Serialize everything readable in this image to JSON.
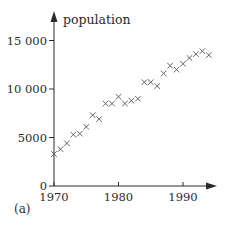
{
  "chart_data": {
    "type": "scatter",
    "title": "",
    "panel_label": "(a)",
    "xlabel": "",
    "ylabel": "population",
    "xlim": [
      1970,
      1995
    ],
    "ylim": [
      0,
      16000
    ],
    "x_ticks": [
      1970,
      1980,
      1990
    ],
    "x_tick_labels": [
      "1970",
      "1980",
      "1990"
    ],
    "y_ticks": [
      0,
      5000,
      10000,
      15000
    ],
    "y_tick_labels": [
      "0",
      "5000",
      "10 000",
      "15 000"
    ],
    "grid": false,
    "legend": null,
    "marker": "x",
    "x": [
      1970,
      1971,
      1972,
      1973,
      1974,
      1975,
      1976,
      1977,
      1978,
      1979,
      1980,
      1981,
      1982,
      1983,
      1984,
      1985,
      1986,
      1987,
      1988,
      1989,
      1990,
      1991,
      1992,
      1993,
      1994
    ],
    "y": [
      3300,
      3800,
      4400,
      5300,
      5400,
      6100,
      7300,
      6900,
      8500,
      8500,
      9200,
      8500,
      8800,
      9000,
      10700,
      10700,
      10300,
      11600,
      12400,
      12000,
      12600,
      13200,
      13600,
      13900,
      13500
    ]
  },
  "colors": {
    "axis": "#2a2a2a",
    "marker": "#555555",
    "background": "#ffffff"
  }
}
